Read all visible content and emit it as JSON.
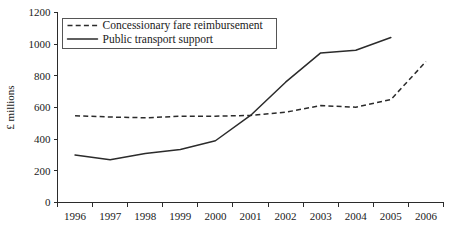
{
  "chart_data": {
    "type": "line",
    "title": "",
    "subtitle": "",
    "xlabel": "",
    "ylabel": "£ millions",
    "categories": [
      "1996",
      "1997",
      "1998",
      "1999",
      "2000",
      "2001",
      "2002",
      "2003",
      "2004",
      "2005",
      "2006"
    ],
    "x": [
      1996,
      1997,
      1998,
      1999,
      2000,
      2001,
      2002,
      2003,
      2004,
      2005,
      2006
    ],
    "xlim": [
      1995.5,
      2006.5
    ],
    "ylim": [
      0,
      1200
    ],
    "yticks": [
      0,
      200,
      400,
      600,
      800,
      1000,
      1200
    ],
    "ytick_labels": [
      "0",
      "200",
      "400",
      "600",
      "800",
      "1000",
      "1200"
    ],
    "grid": false,
    "legend_position": "upper left inside plot",
    "series": [
      {
        "name": "Concessionary fare reimbursement",
        "style": "dashed",
        "color": "#2b2b2b",
        "x": [
          1996,
          1997,
          1998,
          1999,
          2000,
          2001,
          2002,
          2003,
          2004,
          2005,
          2006
        ],
        "values": [
          548,
          540,
          535,
          545,
          545,
          550,
          570,
          612,
          602,
          650,
          890
        ]
      },
      {
        "name": "Public transport support",
        "style": "solid",
        "color": "#2b2b2b",
        "x": [
          1996,
          1997,
          1998,
          1999,
          2000,
          2001,
          2002,
          2003,
          2004,
          2005
        ],
        "values": [
          300,
          270,
          310,
          335,
          390,
          550,
          760,
          945,
          962,
          1042
        ]
      }
    ]
  },
  "legend": {
    "entries": [
      {
        "label": "Concessionary fare reimbursement",
        "style": "dashed"
      },
      {
        "label": "Public transport support",
        "style": "solid"
      }
    ]
  },
  "axes": {
    "y_axis_title": "£ millions",
    "y_tick_labels": [
      "1200",
      "1000",
      "800",
      "600",
      "400",
      "200",
      "0"
    ],
    "x_tick_labels": [
      "1996",
      "1997",
      "1998",
      "1999",
      "2000",
      "2001",
      "2002",
      "2003",
      "2004",
      "2005",
      "2006"
    ]
  }
}
